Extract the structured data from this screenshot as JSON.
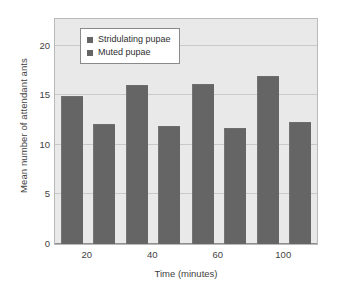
{
  "chart_data": {
    "type": "bar",
    "title": "",
    "xlabel": "Time (minutes)",
    "ylabel": "Mean number of attendant ants",
    "categories": [
      "20",
      "40",
      "60",
      "100"
    ],
    "series": [
      {
        "name": "Stridulating pupae",
        "values": [
          14.9,
          16.0,
          16.1,
          17.0
        ],
        "color": "#656565"
      },
      {
        "name": "Muted pupae",
        "values": [
          12.1,
          11.9,
          11.7,
          12.3
        ],
        "color": "#656565"
      }
    ],
    "ylim": [
      0,
      22.7
    ],
    "yticks": [
      0,
      5,
      10,
      15,
      20
    ],
    "ytick_labels": [
      "0",
      "5",
      "10",
      "15",
      "20"
    ],
    "grid": true,
    "legend_position": "upper-left-inside",
    "plot_background": "#e9e9e9",
    "figure_background": "#ffffff"
  },
  "legend": {
    "items": [
      {
        "label": "Stridulating pupae"
      },
      {
        "label": "Muted pupae"
      }
    ]
  },
  "axes": {
    "y_tick_labels": [
      "20",
      "15",
      "10",
      "5",
      "0"
    ],
    "x_tick_labels": [
      "20",
      "40",
      "60",
      "100"
    ]
  }
}
